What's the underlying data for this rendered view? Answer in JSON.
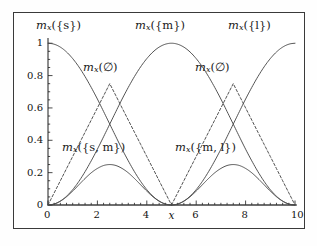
{
  "figure": {
    "background": "#ffffff",
    "frame_color": "#3a3a3a",
    "curve_color": "#4a4a4a"
  },
  "axes": {
    "x_ticks": [
      "0",
      "2",
      "4",
      "6",
      "8",
      "10"
    ],
    "x_tick_values": [
      0,
      2,
      4,
      6,
      8,
      10
    ],
    "y_ticks": [
      "0",
      "0.2",
      "0.4",
      "0.6",
      "0.8",
      "1"
    ],
    "y_tick_values": [
      0,
      0.2,
      0.4,
      0.6,
      0.8,
      1
    ],
    "xlabel": "x",
    "xlabel_value": 5,
    "ylabel": ""
  },
  "labels": {
    "s": {
      "m": "m",
      "sub": "x",
      "arg": "({s})"
    },
    "m": {
      "m": "m",
      "sub": "x",
      "arg": "({m})"
    },
    "l": {
      "m": "m",
      "sub": "x",
      "arg": "({l})"
    },
    "empty_left": {
      "m": "m",
      "sub": "x",
      "arg": "(∅)"
    },
    "empty_right": {
      "m": "m",
      "sub": "x",
      "arg": "(∅)"
    },
    "sm": {
      "m": "m",
      "sub": "x",
      "arg": "({s, m})"
    },
    "ml": {
      "m": "m",
      "sub": "x",
      "arg": "({m, l})"
    }
  },
  "chart_data": {
    "type": "line",
    "title": "",
    "xlabel": "x",
    "ylabel": "",
    "xlim": [
      0,
      10
    ],
    "ylim": [
      0,
      1.02
    ],
    "grid": false,
    "legend": "in-plot annotations",
    "x": [
      0,
      0.25,
      0.5,
      0.75,
      1,
      1.25,
      1.5,
      1.75,
      2,
      2.25,
      2.5,
      2.75,
      3,
      3.25,
      3.5,
      3.75,
      4,
      4.25,
      4.5,
      4.75,
      5,
      5.25,
      5.5,
      5.75,
      6,
      6.25,
      6.5,
      6.75,
      7,
      7.25,
      7.5,
      7.75,
      8,
      8.25,
      8.5,
      8.75,
      9,
      9.25,
      9.5,
      9.75,
      10
    ],
    "series": [
      {
        "name": "m_x({s})",
        "style": "solid",
        "values": [
          1.0,
          0.994,
          0.976,
          0.946,
          0.905,
          0.854,
          0.794,
          0.727,
          0.655,
          0.578,
          0.5,
          0.422,
          0.345,
          0.273,
          0.206,
          0.146,
          0.095,
          0.054,
          0.024,
          0.006,
          0.0,
          0,
          0,
          0,
          0,
          0,
          0,
          0,
          0,
          0,
          0,
          0,
          0,
          0,
          0,
          0,
          0,
          0,
          0,
          0,
          0
        ]
      },
      {
        "name": "m_x({m})",
        "style": "solid",
        "values": [
          0.0,
          0.006,
          0.024,
          0.054,
          0.095,
          0.146,
          0.206,
          0.273,
          0.345,
          0.422,
          0.5,
          0.578,
          0.655,
          0.727,
          0.794,
          0.854,
          0.905,
          0.946,
          0.976,
          0.994,
          1.0,
          0.994,
          0.976,
          0.946,
          0.905,
          0.854,
          0.794,
          0.727,
          0.655,
          0.578,
          0.5,
          0.422,
          0.345,
          0.273,
          0.206,
          0.146,
          0.095,
          0.054,
          0.024,
          0.006,
          0.0
        ]
      },
      {
        "name": "m_x({l})",
        "style": "solid",
        "values": [
          0,
          0,
          0,
          0,
          0,
          0,
          0,
          0,
          0,
          0,
          0,
          0,
          0,
          0,
          0,
          0,
          0,
          0,
          0,
          0,
          0.0,
          0.006,
          0.024,
          0.054,
          0.095,
          0.146,
          0.206,
          0.273,
          0.345,
          0.422,
          0.5,
          0.578,
          0.655,
          0.727,
          0.794,
          0.854,
          0.905,
          0.946,
          0.976,
          0.994,
          1.0
        ]
      },
      {
        "name": "m_x(∅) left",
        "style": "dashed",
        "peak_x": 2.5,
        "peak_y": 0.75,
        "values": [
          0.0,
          0.075,
          0.15,
          0.225,
          0.3,
          0.375,
          0.45,
          0.525,
          0.6,
          0.675,
          0.75,
          0.675,
          0.6,
          0.525,
          0.45,
          0.375,
          0.3,
          0.225,
          0.15,
          0.075,
          0.0,
          null,
          null,
          null,
          null,
          null,
          null,
          null,
          null,
          null,
          null,
          null,
          null,
          null,
          null,
          null,
          null,
          null,
          null,
          null,
          null
        ]
      },
      {
        "name": "m_x(∅) right",
        "style": "dashed",
        "peak_x": 7.5,
        "peak_y": 0.75,
        "values": [
          null,
          null,
          null,
          null,
          null,
          null,
          null,
          null,
          null,
          null,
          null,
          null,
          null,
          null,
          null,
          null,
          null,
          null,
          null,
          null,
          0.0,
          0.075,
          0.15,
          0.225,
          0.3,
          0.375,
          0.45,
          0.525,
          0.6,
          0.675,
          0.75,
          0.675,
          0.6,
          0.525,
          0.45,
          0.375,
          0.3,
          0.225,
          0.15,
          0.075,
          0.0
        ]
      },
      {
        "name": "m_x({s, m})",
        "style": "solid",
        "peak_x": 2.5,
        "peak_y": 0.25,
        "values": [
          0.0,
          0.006,
          0.024,
          0.051,
          0.086,
          0.125,
          0.164,
          0.199,
          0.226,
          0.244,
          0.25,
          0.244,
          0.226,
          0.199,
          0.164,
          0.125,
          0.086,
          0.051,
          0.024,
          0.006,
          0.0,
          null,
          null,
          null,
          null,
          null,
          null,
          null,
          null,
          null,
          null,
          null,
          null,
          null,
          null,
          null,
          null,
          null,
          null,
          null,
          null
        ]
      },
      {
        "name": "m_x({m, l})",
        "style": "solid",
        "peak_x": 7.5,
        "peak_y": 0.25,
        "values": [
          null,
          null,
          null,
          null,
          null,
          null,
          null,
          null,
          null,
          null,
          null,
          null,
          null,
          null,
          null,
          null,
          null,
          null,
          null,
          null,
          0.0,
          0.006,
          0.024,
          0.051,
          0.086,
          0.125,
          0.164,
          0.199,
          0.226,
          0.244,
          0.25,
          0.244,
          0.226,
          0.199,
          0.164,
          0.125,
          0.086,
          0.051,
          0.024,
          0.006,
          0.0
        ]
      }
    ]
  }
}
